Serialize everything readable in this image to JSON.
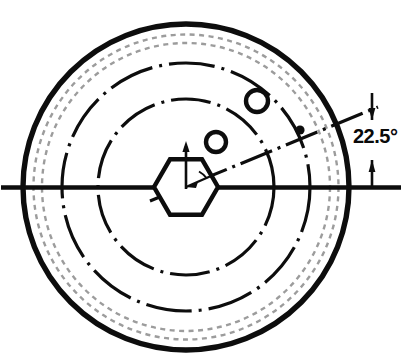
{
  "drawing": {
    "title": "Flywheel / rotor face engineering drawing",
    "background_color": "#ffffff",
    "ink_color": "#0d0d0d",
    "hidden_line_color": "#9a9a9a",
    "canvas": {
      "width": 414,
      "height": 357
    },
    "center": {
      "x": 186,
      "y": 187
    },
    "annotations": {
      "angle_label": "22.5°",
      "angle_value": 22.5,
      "angle_units": "degrees"
    },
    "geometry": {
      "outer_rim_circle": {
        "cx": 186,
        "cy": 187,
        "r": 163,
        "style": "solid-thick",
        "stroke_width": 5
      },
      "hidden_circle_outer": {
        "cx": 186,
        "cy": 187,
        "r": 152,
        "style": "dashed-light",
        "stroke_width": 2
      },
      "hidden_circle_inner": {
        "cx": 186,
        "cy": 187,
        "r": 143,
        "style": "dashed-light",
        "stroke_width": 2
      },
      "bolt_circle_outer": {
        "cx": 186,
        "cy": 187,
        "r": 124,
        "style": "chain-dot",
        "stroke_width": 3
      },
      "bolt_circle_inner": {
        "cx": 186,
        "cy": 187,
        "r": 88,
        "style": "chain-dot",
        "stroke_width": 3
      },
      "hexagon": {
        "cx": 186,
        "cy": 187,
        "circumradius": 32,
        "rotation_deg": 0,
        "style": "solid-thick",
        "stroke_width": 4
      },
      "hole_inner": {
        "cx": 216,
        "cy": 142,
        "r": 10,
        "style": "solid-thick",
        "stroke_width": 4
      },
      "hole_outer": {
        "cx": 257,
        "cy": 101,
        "r": 11,
        "style": "solid-thick",
        "stroke_width": 4
      },
      "center_mark_dot": {
        "cx": 300,
        "cy": 130,
        "r": 4
      },
      "horizontal_centerline": {
        "x1": 2,
        "y1": 187,
        "x2": 400,
        "y2": 187,
        "style": "solid-thick",
        "stroke_width": 4
      },
      "angled_centerline": {
        "x1": 186,
        "y1": 187,
        "x2": 372,
        "y2": 110,
        "angle_deg": 22.5,
        "style": "chain-dot",
        "stroke_width": 3
      },
      "vertical_arrow": {
        "x": 186,
        "y_base": 189,
        "y_tip": 143,
        "style": "solid-thick"
      },
      "dimension_extension_line": {
        "x": 372,
        "y1": 92,
        "y2": 190
      },
      "dimension_arrow_upper": {
        "x": 372,
        "y": 118,
        "points": "up"
      },
      "dimension_arrow_lower": {
        "x": 372,
        "y": 178,
        "points": "down"
      },
      "angle_text_position": {
        "x": 355,
        "y": 142
      }
    },
    "labels": {
      "angle": "22.5°"
    }
  }
}
